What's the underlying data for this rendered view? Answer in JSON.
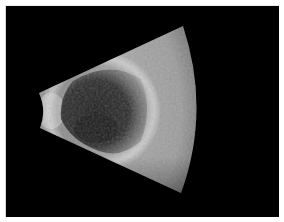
{
  "image": {
    "type": "ultrasound-b-scan",
    "description": "Fan-shaped grayscale ultrasound sector on black background showing a dark hypoechoic cavity bordered by a bright echogenic arc",
    "colors": {
      "background": "#000000",
      "frame_border": "#e0e0e0",
      "tissue_light": "#b8b8b8",
      "tissue_mid": "#7a7a7a",
      "cavity_dark": "#2a2a2a"
    }
  }
}
